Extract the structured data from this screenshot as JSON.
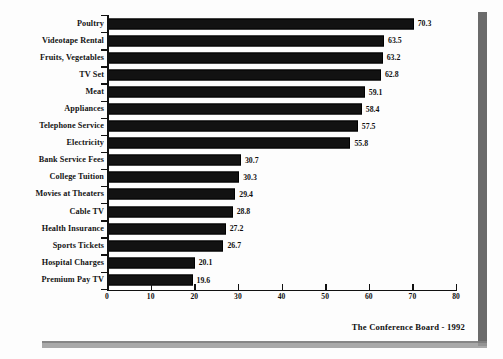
{
  "chart_data": {
    "type": "bar",
    "orientation": "horizontal",
    "title": "",
    "subtitle": "",
    "xlabel": "",
    "ylabel": "",
    "xlim": [
      0,
      80
    ],
    "ylim": null,
    "grid": false,
    "legend": null,
    "legend_position": "none",
    "xticks": [
      "0",
      "10",
      "20",
      "30",
      "40",
      "50",
      "60",
      "70",
      "80"
    ],
    "xtick_values": [
      0,
      10,
      20,
      30,
      40,
      50,
      60,
      70,
      80
    ],
    "categories": [
      "Poultry",
      "Videotape Rental",
      "Fruits, Vegetables",
      "TV Set",
      "Meat",
      "Appliances",
      "Telephone Service",
      "Electricity",
      "Bank Service Fees",
      "College Tuition",
      "Movies at Theaters",
      "Cable TV",
      "Health Insurance",
      "Sports Tickets",
      "Hospital Charges",
      "Premium Pay TV"
    ],
    "values": [
      70.3,
      63.5,
      63.2,
      62.8,
      59.1,
      58.4,
      57.5,
      55.8,
      30.7,
      30.3,
      29.4,
      28.8,
      27.2,
      26.7,
      20.1,
      19.6
    ],
    "value_labels": [
      "70.3",
      "63.5",
      "63.2",
      "62.8",
      "59.1",
      "58.4",
      "57.5",
      "55.8",
      "30.7",
      "30.3",
      "29.4",
      "28.8",
      "27.2",
      "26.7",
      "20.1",
      "19.6"
    ],
    "bar_color": "#121212",
    "annotations": [
      "The Conference Board - 1992"
    ]
  },
  "attribution": {
    "text": "The Conference Board - 1992"
  }
}
